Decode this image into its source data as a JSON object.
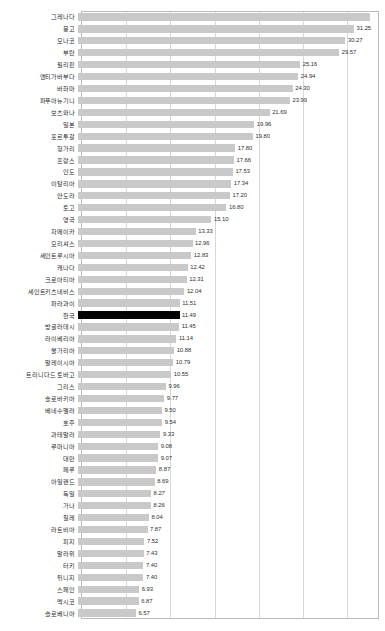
{
  "chart_data": {
    "type": "bar",
    "orientation": "horizontal",
    "title": "",
    "subtitle": "",
    "xlabel": "",
    "ylabel": "",
    "xlim": [
      0,
      33.5
    ],
    "grid": true,
    "gridlines_x": [
      0,
      5,
      10,
      15,
      20,
      25,
      30
    ],
    "legend": null,
    "highlight_category": "한국",
    "highlight_color": "#000000",
    "bar_color": "#c9c9c9",
    "categories": [
      "그레나다",
      "몽고",
      "모나코",
      "부탄",
      "필리핀",
      "앤티가바부다",
      "바하마",
      "파푸아뉴기니",
      "보츠와나",
      "일본",
      "포르투갈",
      "헝가리",
      "프랑스",
      "인도",
      "이탈리아",
      "안도라",
      "토고",
      "영국",
      "자메이카",
      "모리셔스",
      "세인트루시아",
      "캐나다",
      "크로아티아",
      "세인트키츠네비스",
      "파라과이",
      "한국",
      "방글라데시",
      "라이베리아",
      "불가리아",
      "말레이시아",
      "트리니다드 토바고",
      "그리스",
      "슬로바키아",
      "베네수엘라",
      "호주",
      "과테말라",
      "루마니아",
      "대만",
      "페루",
      "아일랜드",
      "독일",
      "가나",
      "칠레",
      "라트비아",
      "피지",
      "말라위",
      "터키",
      "튀니지",
      "스페인",
      "멕시코",
      "슬로베니아"
    ],
    "values": [
      33.1,
      31.25,
      30.27,
      29.57,
      25.16,
      24.94,
      24.3,
      23.99,
      21.69,
      19.96,
      19.8,
      17.8,
      17.66,
      17.53,
      17.34,
      17.2,
      16.8,
      15.1,
      13.33,
      12.96,
      12.83,
      12.42,
      12.31,
      12.04,
      11.51,
      11.49,
      11.45,
      11.14,
      10.88,
      10.79,
      10.55,
      9.96,
      9.77,
      9.5,
      9.54,
      9.33,
      9.08,
      9.07,
      8.87,
      8.69,
      8.27,
      8.26,
      8.04,
      7.87,
      7.52,
      7.43,
      7.4,
      7.4,
      6.93,
      6.87,
      6.57
    ],
    "value_labels": [
      "",
      "31.25",
      "30.27",
      "29.57",
      "25.16",
      "24.94",
      "24.30",
      "23.99",
      "21.69",
      "19.96",
      "19.80",
      "17.80",
      "17.66",
      "17.53",
      "17.34",
      "17.20",
      "16.80",
      "15.10",
      "13.33",
      "12.96",
      "12.83",
      "12.42",
      "12.31",
      "12.04",
      "11.51",
      "11.49",
      "11.45",
      "11.14",
      "10.88",
      "10.79",
      "10.55",
      "9.96",
      "9.77",
      "9.50",
      "9.54",
      "9.33",
      "9.08",
      "9.07",
      "8.87",
      "8.69",
      "8.27",
      "8.26",
      "8.04",
      "7.87",
      "7.52",
      "7.43",
      "7.40",
      "7.40",
      "6.93",
      "6.87",
      "6.57"
    ]
  }
}
